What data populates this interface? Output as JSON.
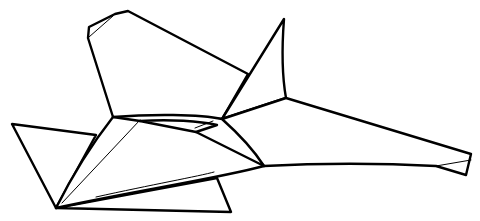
{
  "figure": {
    "title": "Line drawing of a stylized jet aircraft",
    "stroke_color": "#000000",
    "background_color": "#ffffff",
    "width": 480,
    "height": 221
  }
}
